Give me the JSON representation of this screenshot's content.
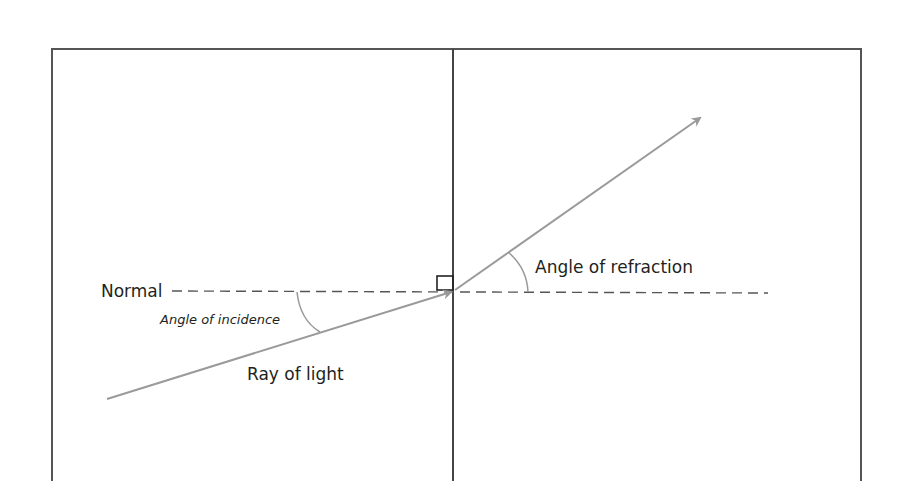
{
  "diagram": {
    "labels": {
      "normal": "Normal",
      "angle_of_incidence": "Angle of incidence",
      "ray_of_light": "Ray of light",
      "angle_of_refraction": "Angle of refraction"
    },
    "colors": {
      "frame": "#4a4a4a",
      "ray": "#9a9a9a",
      "normal_dash": "#555555",
      "text": "#231f20"
    }
  }
}
